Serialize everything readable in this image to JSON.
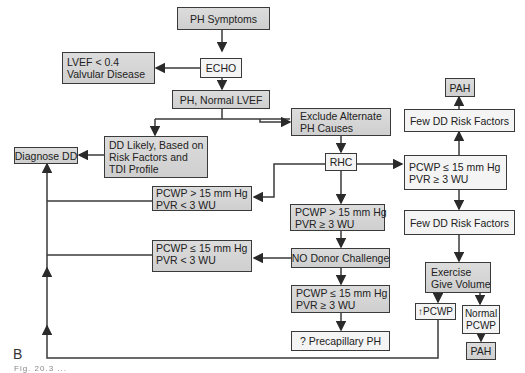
{
  "panel_label": "B",
  "caption_visible_fragment": "Fig. 20.3 ...",
  "colors": {
    "box_gray": "#d4d4d4",
    "box_light": "#f4f4f4",
    "line": "#3a3a3a"
  },
  "nodes": {
    "ph_symptoms": {
      "lines": [
        "PH Symptoms"
      ]
    },
    "echo": {
      "lines": [
        "ECHO"
      ]
    },
    "lvef_valvular": {
      "lines": [
        "LVEF < 0.4",
        "Valvular Disease"
      ]
    },
    "ph_normal_lvef": {
      "lines": [
        "PH, Normal LVEF"
      ]
    },
    "exclude_alternate": {
      "lines": [
        "Exclude Alternate",
        "PH Causes"
      ]
    },
    "dd_likely": {
      "lines": [
        "DD Likely, Based on",
        "Risk Factors and",
        "TDI Profile"
      ]
    },
    "diagnose_dd": {
      "lines": [
        "Diagnose DD"
      ]
    },
    "rhc": {
      "lines": [
        "RHC"
      ]
    },
    "pah_top": {
      "lines": [
        "PAH"
      ]
    },
    "few_dd_upper": {
      "lines": [
        "Few DD Risk Factors"
      ]
    },
    "pcwp_le15_pvr_ge3_right": {
      "lines": [
        "PCWP ≤ 15 mm Hg",
        "PVR ≥ 3 WU"
      ]
    },
    "pcwp_gt15_pvr_lt3": {
      "lines": [
        "PCWP > 15 mm Hg",
        "PVR < 3 WU"
      ]
    },
    "pcwp_gt15_pvr_ge3": {
      "lines": [
        "PCWP > 15 mm Hg",
        "PVR ≥ 3 WU"
      ]
    },
    "few_dd_lower": {
      "lines": [
        "Few DD Risk Factors"
      ]
    },
    "pcwp_le15_pvr_lt3": {
      "lines": [
        "PCWP ≤ 15 mm Hg",
        "PVR < 3 WU"
      ]
    },
    "no_donor_challenge": {
      "lines": [
        "NO Donor Challenge"
      ]
    },
    "exercise_volume": {
      "lines": [
        "Exercise",
        "Give Volume"
      ]
    },
    "pcwp_le15_pvr_ge3_bottom": {
      "lines": [
        "PCWP ≤ 15 mm Hg",
        "PVR ≥ 3 WU"
      ]
    },
    "increased_pcwp": {
      "lines": [
        "↑PCWP"
      ]
    },
    "normal_pcwp": {
      "lines": [
        "Normal",
        "PCWP"
      ]
    },
    "pah_bottom": {
      "lines": [
        "PAH"
      ]
    },
    "precapillary_ph": {
      "lines": [
        "? Precapillary PH"
      ]
    }
  }
}
